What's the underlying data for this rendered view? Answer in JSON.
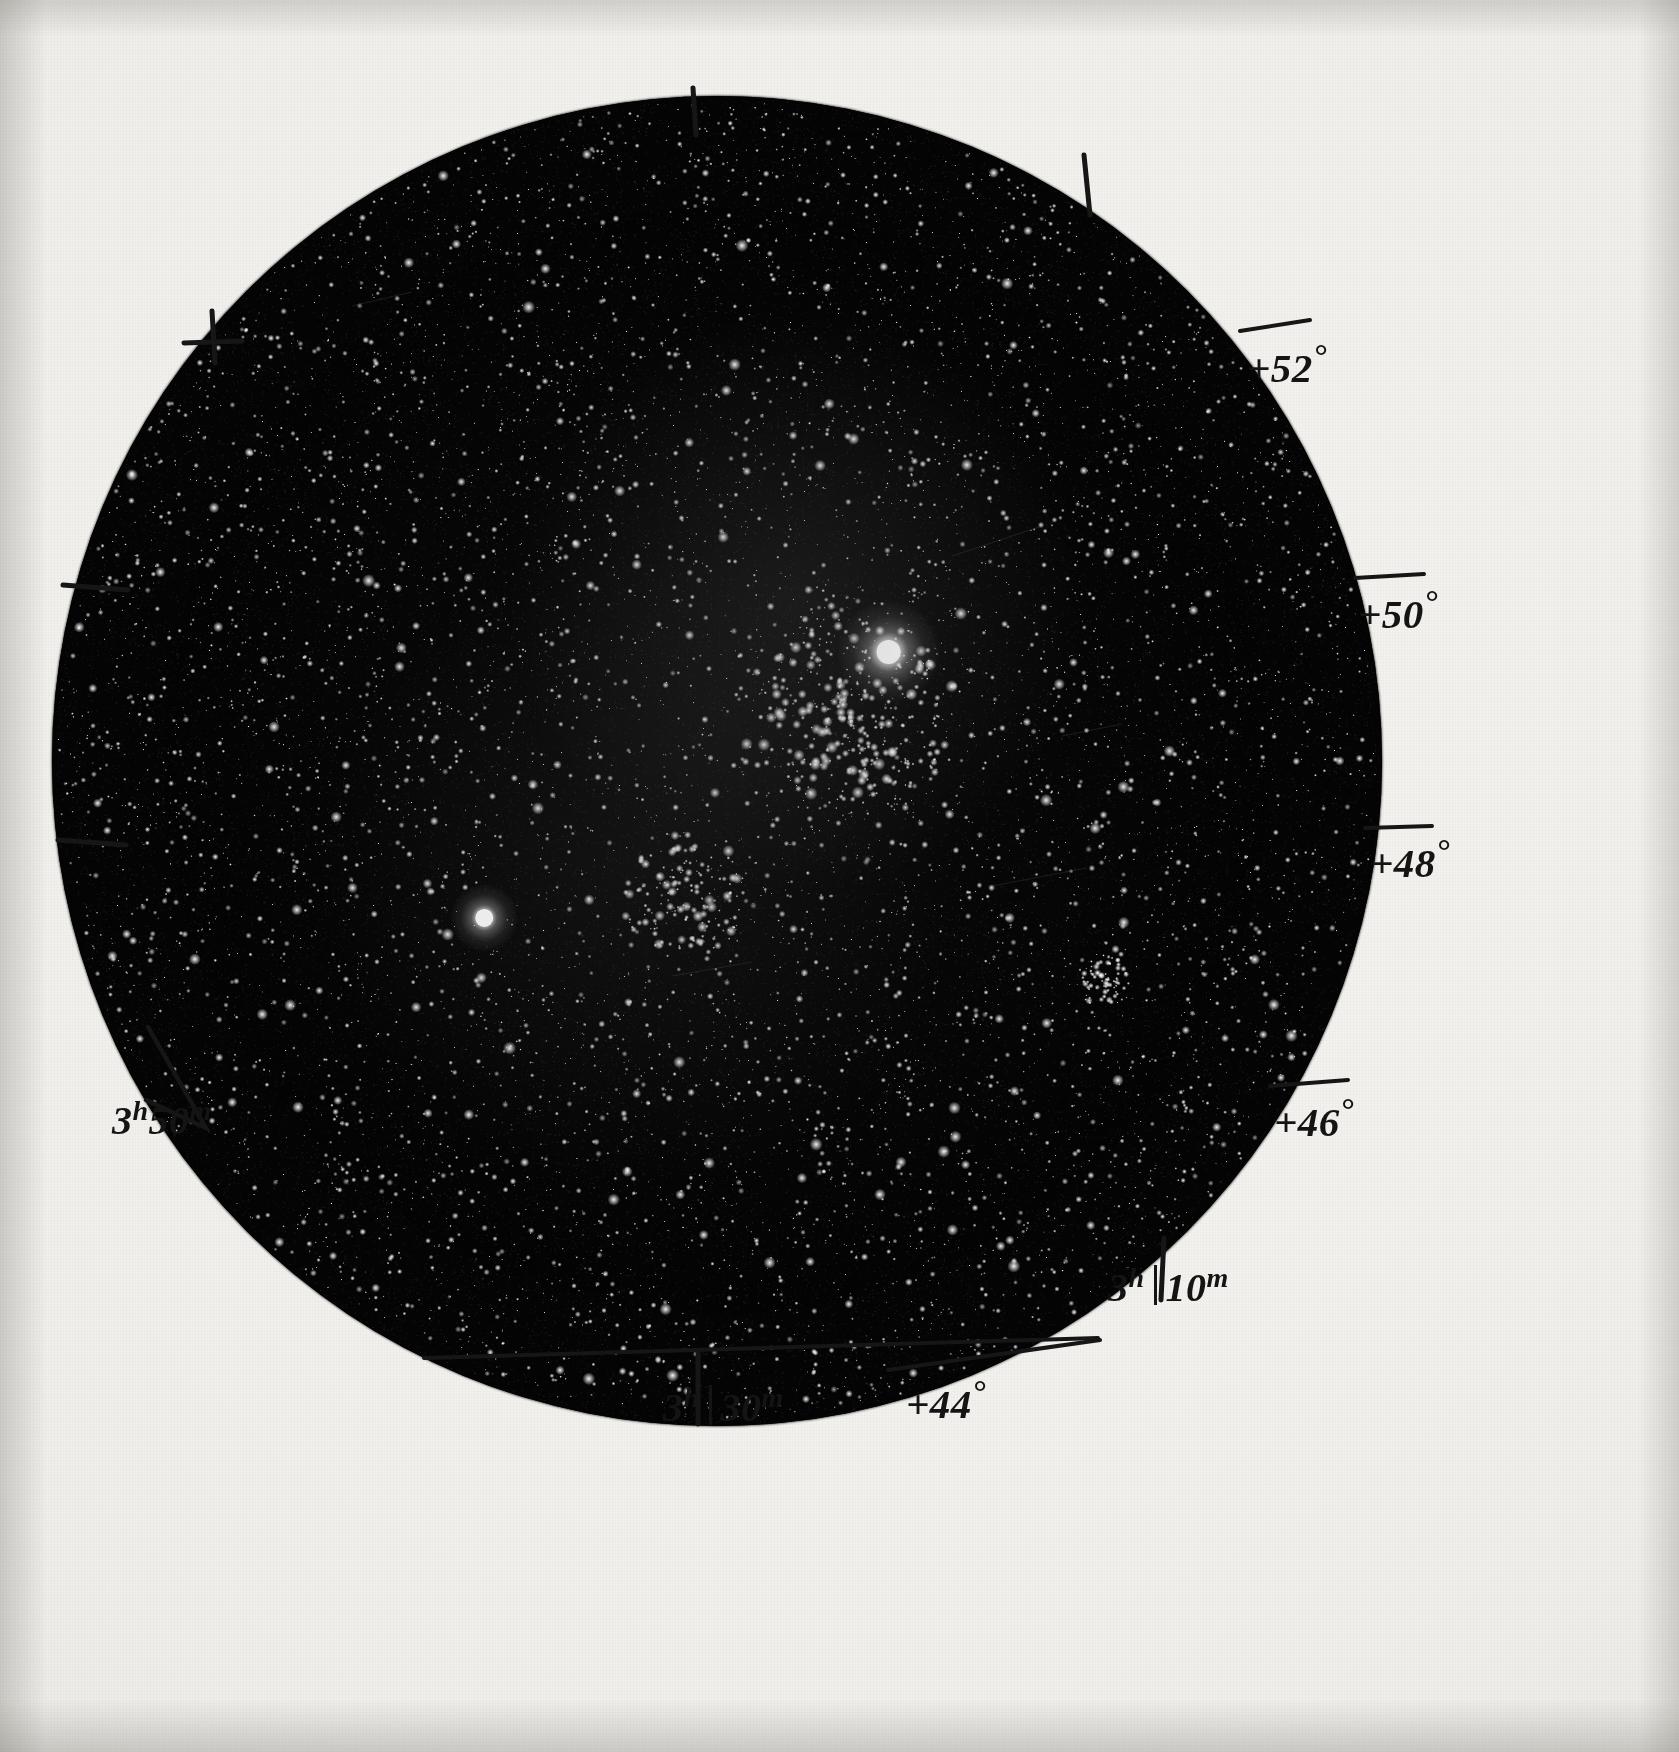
{
  "image": {
    "kind": "astronomical-photographic-plate",
    "field_shape": "circular",
    "background_color": "#f1f0ec",
    "sky_color": "#050505",
    "ink_color": "#141414"
  },
  "coordinate_labels": {
    "declination": [
      {
        "id": "dec-52",
        "text": "+52",
        "degree_symbol": "°",
        "value": 52,
        "x": 1247,
        "y": 337,
        "tick": true
      },
      {
        "id": "dec-50",
        "text": "+50",
        "degree_symbol": "°",
        "value": 50,
        "x": 1358,
        "y": 583,
        "tick": true
      },
      {
        "id": "dec-48",
        "text": "+48",
        "degree_symbol": "°",
        "value": 48,
        "x": 1370,
        "y": 832,
        "tick": true
      },
      {
        "id": "dec-46",
        "text": "+46",
        "degree_symbol": "°",
        "value": 46,
        "x": 1274,
        "y": 1091,
        "tick": true
      },
      {
        "id": "dec-44",
        "text": "+44",
        "degree_symbol": "°",
        "value": 44,
        "x": 906,
        "y": 1373,
        "tick": true
      }
    ],
    "right_ascension": [
      {
        "id": "ra-3h50m",
        "hours": "3",
        "h_symbol": "h",
        "minutes": "50",
        "m_symbol": "m",
        "split": false,
        "x": 112,
        "y": 1095,
        "tick": "bracket"
      },
      {
        "id": "ra-3h10m",
        "hours": "3",
        "h_symbol": "h",
        "minutes": "10",
        "m_symbol": "m",
        "split": true,
        "x": 1108,
        "y": 1262,
        "tick": "vertical"
      },
      {
        "id": "ra-3h30m",
        "hours": "3",
        "h_symbol": "h",
        "minutes": "30",
        "m_symbol": "m",
        "split": true,
        "x": 663,
        "y": 1382,
        "tick": "vertical"
      }
    ]
  },
  "tick_marks": [
    {
      "id": "tick-top-vertical",
      "type": "line",
      "x1": 693,
      "y1": 88,
      "x2": 696,
      "y2": 135
    },
    {
      "id": "tick-upper-right-vertical",
      "type": "line",
      "x1": 1084,
      "y1": 155,
      "x2": 1090,
      "y2": 215
    },
    {
      "id": "tick-upper-left-cross-v",
      "type": "line",
      "x1": 212,
      "y1": 311,
      "x2": 215,
      "y2": 363
    },
    {
      "id": "tick-upper-left-cross-h",
      "type": "line",
      "x1": 184,
      "y1": 343,
      "x2": 242,
      "y2": 341
    },
    {
      "id": "tick-left-upper-horizontal",
      "type": "line",
      "x1": 63,
      "y1": 585,
      "x2": 128,
      "y2": 590
    },
    {
      "id": "tick-left-lower-horizontal",
      "type": "line",
      "x1": 58,
      "y1": 840,
      "x2": 126,
      "y2": 845
    },
    {
      "id": "tick-dec52-line",
      "type": "line",
      "x1": 1240,
      "y1": 331,
      "x2": 1310,
      "y2": 320
    },
    {
      "id": "tick-dec50-line",
      "type": "line",
      "x1": 1355,
      "y1": 578,
      "x2": 1424,
      "y2": 574
    },
    {
      "id": "tick-dec48-line",
      "type": "line",
      "x1": 1365,
      "y1": 828,
      "x2": 1432,
      "y2": 826
    },
    {
      "id": "tick-dec46-line",
      "type": "line",
      "x1": 1270,
      "y1": 1086,
      "x2": 1348,
      "y2": 1080
    },
    {
      "id": "tick-ra3h10m-vertical",
      "type": "line",
      "x1": 1164,
      "y1": 1238,
      "x2": 1161,
      "y2": 1300
    },
    {
      "id": "tick-ra3h30m-vertical",
      "type": "line",
      "x1": 698,
      "y1": 1352,
      "x2": 698,
      "y2": 1424
    },
    {
      "id": "tick-bottom-long-line",
      "type": "line",
      "x1": 424,
      "y1": 1358,
      "x2": 1098,
      "y2": 1338
    },
    {
      "id": "tick-dec44-line",
      "type": "line",
      "x1": 888,
      "y1": 1370,
      "x2": 1100,
      "y2": 1340
    },
    {
      "id": "tick-ra3h50m-bracket",
      "type": "polyline",
      "points": "148,1027 206,1128 146,1100"
    }
  ],
  "chart_data": {
    "type": "scatter",
    "title": "",
    "xlabel": "Right Ascension",
    "ylabel": "Declination",
    "xlim": [
      "3h10m",
      "3h50m"
    ],
    "ylim": [
      44,
      52
    ],
    "grid": false,
    "legend_position": "none",
    "ra_ticks": [
      "3h10m",
      "3h30m",
      "3h50m"
    ],
    "dec_ticks": [
      "+44°",
      "+46°",
      "+48°",
      "+50°",
      "+52°"
    ],
    "features": [
      {
        "name": "dominant-bright-star",
        "x_frac": 0.629,
        "y_frac": 0.418,
        "magnitude_rank": 1
      },
      {
        "name": "secondary-bright-star",
        "x_frac": 0.325,
        "y_frac": 0.618,
        "magnitude_rank": 2
      },
      {
        "name": "cluster-core-concentration",
        "x_frac": 0.6,
        "y_frac": 0.47,
        "magnitude_rank": 3
      },
      {
        "name": "lower-cluster-knot",
        "x_frac": 0.475,
        "y_frac": 0.602,
        "magnitude_rank": 4
      },
      {
        "name": "compact-cluster-right",
        "x_frac": 0.79,
        "y_frac": 0.665,
        "magnitude_rank": 5
      }
    ],
    "star_count_visible": "several thousand"
  }
}
